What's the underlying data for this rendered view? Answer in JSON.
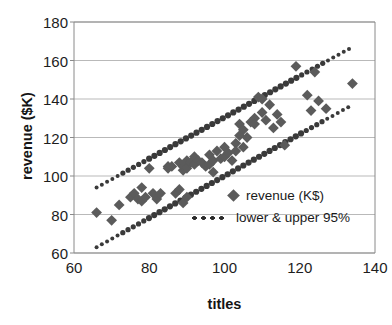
{
  "chart_data": {
    "type": "scatter",
    "title": "",
    "xlabel": "titles",
    "ylabel": "revenue ($K)",
    "xlim": [
      60,
      140
    ],
    "ylim": [
      60,
      180
    ],
    "xticks": [
      60,
      80,
      100,
      120,
      140
    ],
    "yticks": [
      60,
      80,
      100,
      120,
      140,
      160,
      180
    ],
    "grid": "horizontal",
    "legend_position": "inside-lower-right",
    "colors": {
      "marker": "#5b5b5b",
      "band": "#3a3a3a",
      "grid": "#b9b9b9",
      "axis": "#8a8a8a",
      "text": "#1a1a1a"
    },
    "series": [
      {
        "name": "revenue (K$)",
        "marker": "diamond",
        "points": [
          [
            66,
            81
          ],
          [
            70,
            77
          ],
          [
            72,
            85
          ],
          [
            75,
            89
          ],
          [
            76,
            91
          ],
          [
            77,
            88
          ],
          [
            78,
            94
          ],
          [
            78,
            87
          ],
          [
            79,
            89
          ],
          [
            80,
            104
          ],
          [
            81,
            91
          ],
          [
            82,
            88
          ],
          [
            83,
            91
          ],
          [
            85,
            105
          ],
          [
            85,
            104
          ],
          [
            86,
            105
          ],
          [
            87,
            91
          ],
          [
            88,
            93
          ],
          [
            88,
            107
          ],
          [
            89,
            103
          ],
          [
            89,
            105
          ],
          [
            89,
            86
          ],
          [
            90,
            108
          ],
          [
            90,
            104
          ],
          [
            90,
            89
          ],
          [
            91,
            107
          ],
          [
            92,
            106
          ],
          [
            92,
            110
          ],
          [
            93,
            108
          ],
          [
            94,
            107
          ],
          [
            95,
            105
          ],
          [
            96,
            111
          ],
          [
            96,
            106
          ],
          [
            97,
            102
          ],
          [
            97,
            108
          ],
          [
            98,
            113
          ],
          [
            99,
            109
          ],
          [
            100,
            115
          ],
          [
            100,
            110
          ],
          [
            101,
            112
          ],
          [
            102,
            108
          ],
          [
            103,
            117
          ],
          [
            103,
            113
          ],
          [
            104,
            127
          ],
          [
            104,
            121
          ],
          [
            105,
            115
          ],
          [
            105,
            124
          ],
          [
            106,
            120
          ],
          [
            107,
            128
          ],
          [
            108,
            130
          ],
          [
            108,
            127
          ],
          [
            109,
            141
          ],
          [
            110,
            133
          ],
          [
            110,
            140
          ],
          [
            111,
            129
          ],
          [
            112,
            137
          ],
          [
            113,
            125
          ],
          [
            114,
            132
          ],
          [
            115,
            128
          ],
          [
            116,
            116
          ],
          [
            119,
            157
          ],
          [
            122,
            142
          ],
          [
            123,
            134
          ],
          [
            124,
            154
          ],
          [
            125,
            139
          ],
          [
            127,
            135
          ],
          [
            134,
            148
          ]
        ]
      }
    ],
    "bands": [
      {
        "name": "upper 95%",
        "style": "dotted",
        "x": [
          66,
          134
        ],
        "y": [
          94,
          167
        ]
      },
      {
        "name": "lower 95%",
        "style": "dotted",
        "x": [
          66,
          134
        ],
        "y": [
          63,
          137
        ]
      }
    ],
    "legend_entries": [
      {
        "label": "revenue (K$)",
        "marker": "diamond"
      },
      {
        "label": "lower & upper 95%",
        "marker": "dotted-line"
      }
    ]
  }
}
